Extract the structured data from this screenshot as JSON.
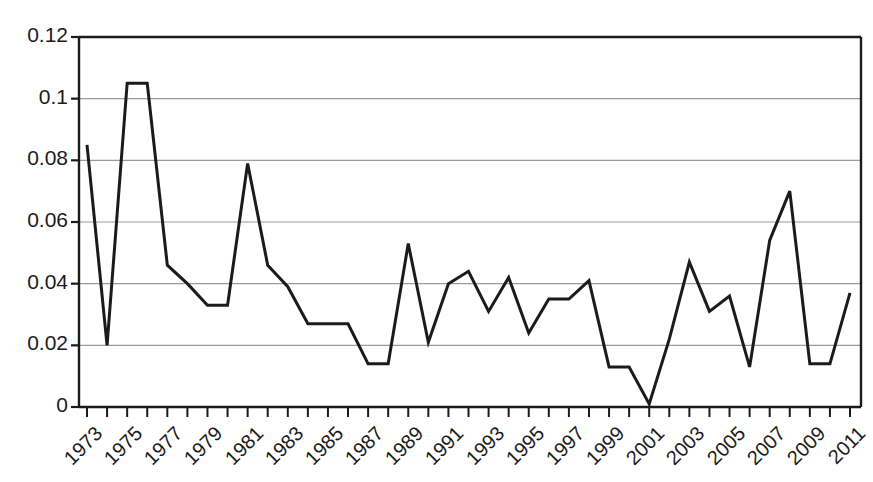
{
  "chart_data": {
    "type": "line",
    "title": "",
    "subtitle": "",
    "xlabel": "",
    "ylabel": "",
    "grid": true,
    "grid_axis": "y",
    "legend": false,
    "legend_position": "none",
    "xlim": [
      1973,
      2011
    ],
    "ylim": [
      0,
      0.12
    ],
    "ytick_labels": [
      "0.12",
      "0.1",
      "0.08",
      "0.06",
      "0.04",
      "0.02",
      "0"
    ],
    "ytick_values": [
      0.12,
      0.1,
      0.08,
      0.06,
      0.04,
      0.02,
      0
    ],
    "xtick_labels": [
      "1973",
      "1975",
      "1977",
      "1979",
      "1981",
      "1983",
      "1985",
      "1987",
      "1989",
      "1991",
      "1993",
      "1995",
      "1997",
      "1999",
      "2001",
      "2003",
      "2005",
      "2007",
      "2009",
      "2011"
    ],
    "xtick_values": [
      1973,
      1975,
      1977,
      1979,
      1981,
      1983,
      1985,
      1987,
      1989,
      1991,
      1993,
      1995,
      1997,
      1999,
      2001,
      2003,
      2005,
      2007,
      2009,
      2011
    ],
    "x": [
      1973,
      1974,
      1975,
      1976,
      1977,
      1978,
      1979,
      1980,
      1981,
      1982,
      1983,
      1984,
      1985,
      1986,
      1987,
      1988,
      1989,
      1990,
      1991,
      1992,
      1993,
      1994,
      1995,
      1996,
      1997,
      1998,
      1999,
      2000,
      2001,
      2002,
      2003,
      2004,
      2005,
      2006,
      2007,
      2008,
      2009,
      2010,
      2011
    ],
    "values": [
      0.085,
      0.02,
      0.105,
      0.105,
      0.046,
      0.04,
      0.033,
      0.033,
      0.079,
      0.046,
      0.039,
      0.027,
      0.027,
      0.027,
      0.014,
      0.014,
      0.053,
      0.021,
      0.04,
      0.044,
      0.031,
      0.042,
      0.024,
      0.035,
      0.035,
      0.041,
      0.013,
      0.013,
      0.001,
      0.022,
      0.047,
      0.031,
      0.036,
      0.013,
      0.054,
      0.07,
      0.014,
      0.014,
      0.037
    ],
    "series_name": "series-1",
    "line_color": "#1b1b1b",
    "line_width": 3,
    "grid_color": "#9a9a9a",
    "axis_color": "#1b1b1b",
    "background": "#ffffff"
  }
}
